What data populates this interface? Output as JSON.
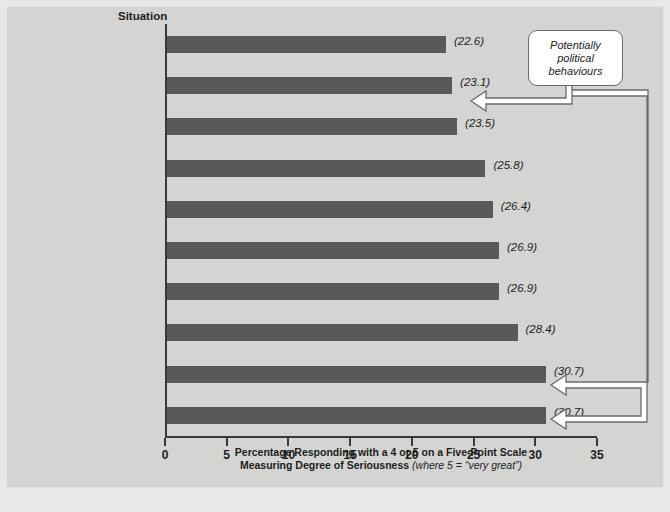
{
  "chart_data": {
    "type": "bar",
    "orientation": "horizontal",
    "title": "",
    "column_header": "Situation",
    "xlabel_line1": "Percentage Responding with a 4 or 5 on a Five-Point Scale",
    "xlabel_line2": "Measuring Degree of Seriousness ",
    "xlabel_note": "(where 5 = “very great”)",
    "ylabel": "Situation",
    "xlim": [
      0,
      35
    ],
    "xticks": [
      0,
      5,
      10,
      15,
      20,
      25,
      30,
      35
    ],
    "grid": false,
    "legend": "none",
    "bar_color": "#595957",
    "plot_background": "#d4d4d2",
    "axis_color": "#3a3a38",
    "categories": [
      "Gender discrimination\nin recruitment or hiring",
      "Arrangements with vendors\nleading to personal gain",
      "Nonperformance factors\nused in appraisals",
      "Gender discrimination\nin compensation",
      "Not maintaining\nconfidentiality",
      "Using discipline\ninconsistently",
      "Gender discrimination\nin promotion",
      "Sexual\nharassment",
      "Allowing differences in pay\ndue to friendships",
      "Hiring, training, or promoting\nbased on favouritism"
    ],
    "values": [
      22.6,
      23.1,
      23.5,
      25.8,
      26.4,
      26.9,
      26.9,
      28.4,
      30.7,
      30.7
    ],
    "value_labels": [
      "(22.6)",
      "(23.1)",
      "(23.5)",
      "(25.8)",
      "(26.4)",
      "(26.9)",
      "(26.9)",
      "(28.4)",
      "(30.7)",
      "(30.7)"
    ],
    "annotations": [
      {
        "text": "Potentially\npolitical\nbehaviours",
        "points_to": [
          "Arrangements with vendors\nleading to personal gain",
          "Allowing differences in pay\ndue to friendships",
          "Hiring, training, or promoting\nbased on favouritism"
        ]
      }
    ]
  },
  "callout": {
    "text": "Potentially\npolitical\nbehaviours"
  }
}
